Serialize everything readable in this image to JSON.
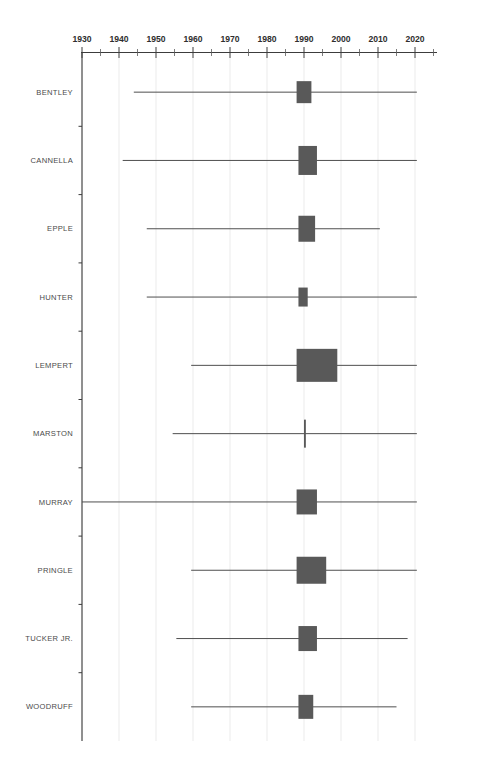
{
  "title": "",
  "chart_data": {
    "type": "bar",
    "subtype": "forest-plot",
    "title": "",
    "xlabel": "",
    "ylabel": "",
    "xlim": [
      1930,
      2022
    ],
    "grid": true,
    "legend": null,
    "x_major_ticks": [
      1930,
      1940,
      1950,
      1960,
      1970,
      1980,
      1990,
      2000,
      2010,
      2020
    ],
    "x_major_tick_labels": [
      "1930",
      "1940",
      "1950",
      "1960",
      "1970",
      "1980",
      "1990",
      "2000",
      "2010",
      "2020"
    ],
    "x_minor_tick_step": 5,
    "categories": [
      "BENTLEY",
      "CANNELLA",
      "EPPLE",
      "HUNTER",
      "LEMPERT",
      "MARSTON",
      "MURRAY",
      "PRINGLE",
      "TUCKER JR.",
      "WOODRUFF"
    ],
    "box_color": "#595959",
    "line_color": "#4f4f4f",
    "series": [
      {
        "name": "BENTLEY",
        "line_start": 1944.0,
        "line_end": 2020.5,
        "box_start": 1988.0,
        "box_end": 1992.0,
        "box_center": 1990.0,
        "box_half_height": 11.0
      },
      {
        "name": "CANNELLA",
        "line_start": 1941.0,
        "line_end": 2020.5,
        "box_start": 1988.5,
        "box_end": 1993.5,
        "box_center": 1991.0,
        "box_half_height": 14.5
      },
      {
        "name": "EPPLE",
        "line_start": 1947.5,
        "line_end": 2010.5,
        "box_start": 1988.5,
        "box_end": 1993.0,
        "box_center": 1990.7,
        "box_half_height": 13.0
      },
      {
        "name": "HUNTER",
        "line_start": 1947.5,
        "line_end": 2020.5,
        "box_start": 1988.5,
        "box_end": 1991.0,
        "box_center": 1989.7,
        "box_half_height": 9.5
      },
      {
        "name": "LEMPERT",
        "line_start": 1959.5,
        "line_end": 2020.5,
        "box_start": 1988.0,
        "box_end": 1999.0,
        "box_center": 1993.5,
        "box_half_height": 16.5
      },
      {
        "name": "MARSTON",
        "line_start": 1954.5,
        "line_end": 2020.5,
        "box_start": 1990.0,
        "box_end": 1990.5,
        "box_center": 1990.2,
        "box_half_height": 14.0
      },
      {
        "name": "MURRAY",
        "line_start": 1930.0,
        "line_end": 2020.5,
        "box_start": 1988.0,
        "box_end": 1993.5,
        "box_center": 1990.7,
        "box_half_height": 12.5
      },
      {
        "name": "PRINGLE",
        "line_start": 1959.5,
        "line_end": 2020.5,
        "box_start": 1988.0,
        "box_end": 1996.0,
        "box_center": 1992.0,
        "box_half_height": 13.5
      },
      {
        "name": "TUCKER JR.",
        "line_start": 1955.5,
        "line_end": 2018.0,
        "box_start": 1988.5,
        "box_end": 1993.5,
        "box_center": 1991.0,
        "box_half_height": 12.5
      },
      {
        "name": "WOODRUFF",
        "line_start": 1959.5,
        "line_end": 2015.0,
        "box_start": 1988.5,
        "box_end": 1992.5,
        "box_center": 1990.5,
        "box_half_height": 12.0
      }
    ]
  }
}
